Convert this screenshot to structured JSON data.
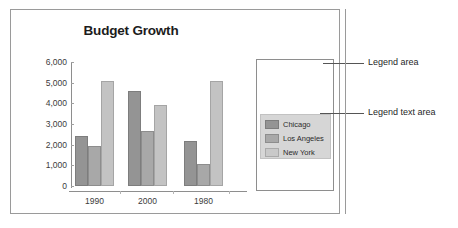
{
  "chart_data": {
    "type": "bar",
    "title": "Budget Growth",
    "xlabel": "",
    "ylabel": "",
    "categories": [
      "1990",
      "2000",
      "1980"
    ],
    "series": [
      {
        "name": "Chicago",
        "values": [
          2400,
          4600,
          2200
        ],
        "color": "#949494"
      },
      {
        "name": "Los Angeles",
        "values": [
          1950,
          2650,
          1050
        ],
        "color": "#a8a8a8"
      },
      {
        "name": "New York",
        "values": [
          5100,
          3900,
          5100
        ],
        "color": "#c3c3c3"
      }
    ],
    "ylim": [
      0,
      6000
    ],
    "ytick_labels": [
      "6,000",
      "5,000",
      "4,000",
      "3,000",
      "2,000",
      "1,000",
      "0"
    ],
    "ytick_values": [
      6000,
      5000,
      4000,
      3000,
      2000,
      1000,
      0
    ],
    "grid": false,
    "legend_position": "right"
  },
  "legend": {
    "entries": [
      {
        "label": "Chicago"
      },
      {
        "label": "Los Angeles"
      },
      {
        "label": "New York"
      }
    ]
  },
  "annotations": [
    {
      "label": "Legend area"
    },
    {
      "label": "Legend text area"
    }
  ]
}
